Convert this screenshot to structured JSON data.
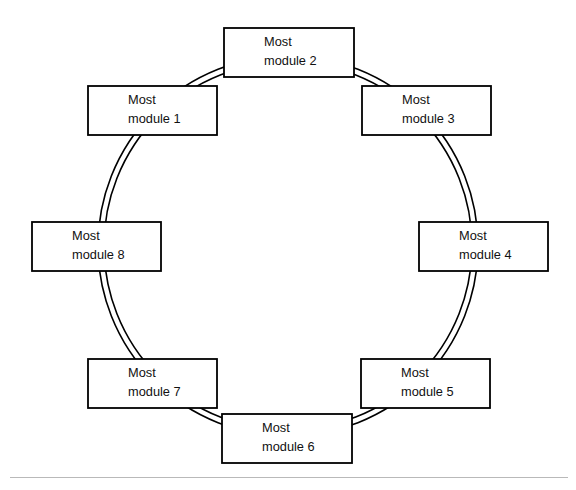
{
  "diagram": {
    "type": "ring-network-diagram",
    "title": "",
    "shape": "circle",
    "ring": {
      "name": "double-ring",
      "center_x": 288,
      "center_y": 246,
      "outer_radius": 190,
      "inner_radius": 184,
      "stroke_color": "#000000"
    },
    "footer_rule_color": "#b9b9b9",
    "nodes": [
      {
        "id": "module-1",
        "line1": "Most",
        "line2": "module 1",
        "x": 88,
        "y": 86,
        "w": 129,
        "h": 49,
        "angle_deg": 225
      },
      {
        "id": "module-2",
        "line1": "Most",
        "line2": "module 2",
        "x": 224,
        "y": 28,
        "w": 130,
        "h": 49,
        "angle_deg": 270
      },
      {
        "id": "module-3",
        "line1": "Most",
        "line2": "module 3",
        "x": 362,
        "y": 86,
        "w": 129,
        "h": 49,
        "angle_deg": 315
      },
      {
        "id": "module-4",
        "line1": "Most",
        "line2": "module 4",
        "x": 419,
        "y": 222,
        "w": 129,
        "h": 49,
        "angle_deg": 0
      },
      {
        "id": "module-5",
        "line1": "Most",
        "line2": "module 5",
        "x": 361,
        "y": 359,
        "w": 129,
        "h": 49,
        "angle_deg": 45
      },
      {
        "id": "module-6",
        "line1": "Most",
        "line2": "module 6",
        "x": 222,
        "y": 414,
        "w": 130,
        "h": 49,
        "angle_deg": 90
      },
      {
        "id": "module-7",
        "line1": "Most",
        "line2": "module 7",
        "x": 88,
        "y": 359,
        "w": 129,
        "h": 49,
        "angle_deg": 135
      },
      {
        "id": "module-8",
        "line1": "Most",
        "line2": "module 8",
        "x": 32,
        "y": 222,
        "w": 129,
        "h": 49,
        "angle_deg": 180
      }
    ]
  }
}
